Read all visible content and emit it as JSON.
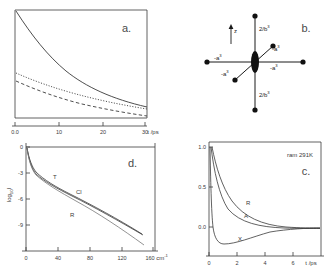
{
  "figure": {
    "panels": [
      "a",
      "b",
      "c",
      "d"
    ],
    "background": "#ffffff",
    "line_color": "#3a3a3a"
  },
  "panel_a": {
    "label": "a.",
    "xaxis": {
      "label": "t /ps",
      "ticks": [
        "0.0",
        "10",
        "20",
        "30"
      ],
      "values": [
        0,
        10,
        20,
        30
      ],
      "min": 0,
      "max": 34
    },
    "yaxis": {
      "min": 0,
      "max": 1.0,
      "ticks": []
    },
    "curves": [
      {
        "name": "solid-decay",
        "style": "solid",
        "start": 1.0,
        "end": 0.2
      },
      {
        "name": "dotted-decay",
        "style": "dotted",
        "start": 0.42,
        "end": 0.09
      },
      {
        "name": "dashed-decay",
        "style": "dashed",
        "start": 0.34,
        "end": 0.055
      }
    ]
  },
  "panel_b": {
    "label": "b.",
    "axis_arrow_label": "z",
    "vertical_label_top": "2/b",
    "vertical_label_top_sup": "3",
    "vertical_label_bottom": "2/b",
    "vertical_label_bottom_sup": "3",
    "left_label": "-a",
    "left_label_sup": "3",
    "right_label": "-a",
    "right_label_sup": "3",
    "upper_right_label": "-a",
    "upper_right_label_sup": "3",
    "lower_left_label": "-a",
    "lower_left_label_sup": "3",
    "node_count": 6,
    "description": "star of neighbour vectors around central ellipse"
  },
  "panel_c": {
    "label": "c.",
    "annotation": "ram 291K",
    "xaxis": {
      "label": "t /ps",
      "ticks": [
        "0",
        "2",
        "4",
        "6"
      ],
      "values": [
        0,
        2,
        4,
        6
      ],
      "min": 0,
      "max": 7.6
    },
    "yaxis": {
      "ticks": [
        "1.0",
        "0.5",
        "0.0"
      ],
      "values": [
        1.0,
        0.5,
        0.0
      ],
      "min": -0.25,
      "max": 1.05
    },
    "curves": [
      {
        "name": "R",
        "label": "R",
        "start": 1.0,
        "end": 0.03
      },
      {
        "name": "A",
        "label": "A",
        "start": 1.0,
        "end": 0.02
      },
      {
        "name": "X",
        "label": "X",
        "start": 1.0,
        "min": -0.18,
        "end": 0.01
      }
    ]
  },
  "panel_d": {
    "label": "d.",
    "xaxis": {
      "label": "cm",
      "label_sup": "-1",
      "ticks": [
        "0",
        "40",
        "80",
        "120",
        "160"
      ],
      "values": [
        0,
        40,
        80,
        120,
        160
      ],
      "min": 0,
      "max": 178
    },
    "yaxis": {
      "label": "log",
      "label_sub": "10",
      "label_tail": "I",
      "ticks": [
        "0",
        "-3",
        "-6",
        "-9"
      ],
      "values": [
        0,
        -3,
        -6,
        -9
      ],
      "min": -12.4,
      "max": 0.4
    },
    "curves": [
      {
        "name": "T",
        "label": "T"
      },
      {
        "name": "Cl",
        "label": "Cl"
      },
      {
        "name": "R",
        "label": "R"
      }
    ]
  }
}
